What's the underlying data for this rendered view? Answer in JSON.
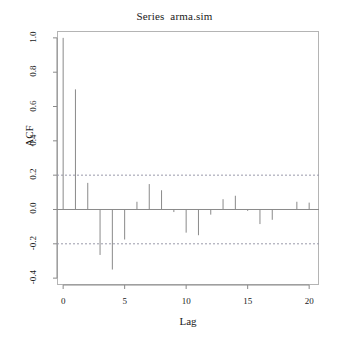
{
  "chart_data": {
    "type": "bar",
    "title": "Series  arma.sim",
    "xlabel": "Lag",
    "ylabel": "ACF",
    "grid": false,
    "legend": "none",
    "xlim": [
      -0.5,
      20.8
    ],
    "ylim": [
      -0.44,
      1.04
    ],
    "x": [
      0,
      1,
      2,
      3,
      4,
      5,
      6,
      7,
      8,
      9,
      10,
      11,
      12,
      13,
      14,
      15,
      16,
      17,
      18,
      19,
      20
    ],
    "values": [
      1.0,
      0.7,
      0.155,
      -0.265,
      -0.35,
      -0.175,
      0.045,
      0.148,
      0.112,
      -0.015,
      -0.135,
      -0.15,
      -0.03,
      0.06,
      0.08,
      -0.008,
      -0.085,
      -0.06,
      0.0,
      0.045,
      0.04
    ],
    "categories": [
      "0",
      "1",
      "2",
      "3",
      "4",
      "5",
      "6",
      "7",
      "8",
      "9",
      "10",
      "11",
      "12",
      "13",
      "14",
      "15",
      "16",
      "17",
      "18",
      "19",
      "20"
    ],
    "xticks": [
      0,
      5,
      10,
      15,
      20
    ],
    "xtick_labels": [
      "0",
      "5",
      "10",
      "15",
      "20"
    ],
    "yticks": [
      1.0,
      0.8,
      0.6,
      0.4,
      0.2,
      0.0,
      -0.2,
      -0.4
    ],
    "ytick_labels": [
      "1.0",
      "0.8",
      "0.6",
      "0.4",
      "0.2",
      "0.0",
      "-0.2",
      "-0.4"
    ],
    "confidence_bands": [
      0.2,
      -0.2
    ],
    "zero_line": 0.0,
    "colors": {
      "bar": "#8a8a8a",
      "axis": "#8a8a8a",
      "frame": "#b4b4b4",
      "confidence": "#9a9aaa",
      "text": "#1a1a1a",
      "background": "#ffffff"
    }
  },
  "axes": {
    "y_title": "ACF",
    "x_title": "Lag"
  },
  "header": {
    "title": "Series  arma.sim"
  }
}
